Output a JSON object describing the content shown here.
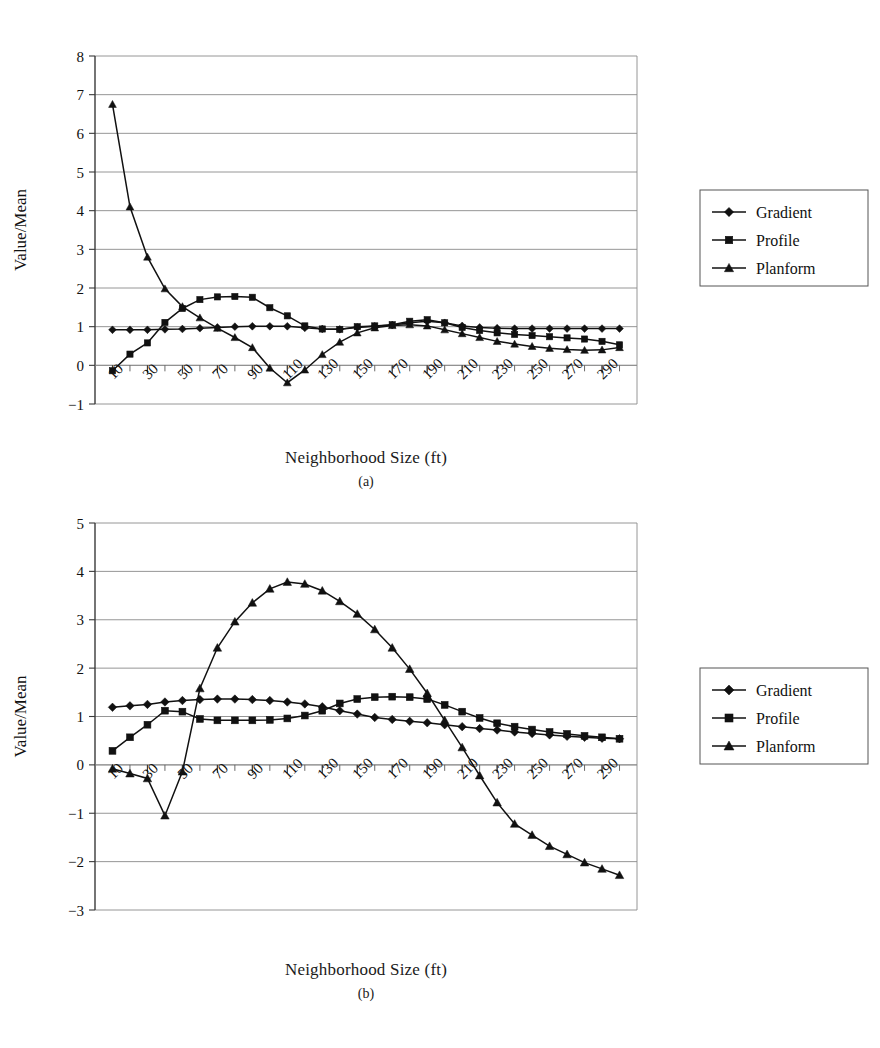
{
  "figure": {
    "panels": [
      {
        "id": "a",
        "caption": "(a)",
        "xlabel": "Neighborhood Size (ft)",
        "ylabel": "Value/Mean"
      },
      {
        "id": "b",
        "caption": "(b)",
        "xlabel": "Neighborhood Size (ft)",
        "ylabel": "Value/Mean"
      }
    ],
    "legend": {
      "entries": [
        {
          "label": "Gradient",
          "marker": "diamond"
        },
        {
          "label": "Profile",
          "marker": "square"
        },
        {
          "label": "Planform",
          "marker": "triangle"
        }
      ]
    }
  },
  "chart_data": [
    {
      "type": "line",
      "panel": "a",
      "title": "",
      "xlabel": "Neighborhood Size (ft)",
      "ylabel": "Value/Mean",
      "x": [
        10,
        20,
        30,
        40,
        50,
        60,
        70,
        80,
        90,
        100,
        110,
        120,
        130,
        140,
        150,
        160,
        170,
        180,
        190,
        200,
        210,
        220,
        230,
        240,
        250,
        260,
        270,
        280,
        290,
        300
      ],
      "xlim": [
        0,
        310
      ],
      "ylim": [
        -1,
        8
      ],
      "yticks": [
        -1,
        0,
        1,
        2,
        3,
        4,
        5,
        6,
        7,
        8
      ],
      "xticks": [
        10,
        30,
        50,
        70,
        90,
        110,
        130,
        150,
        170,
        190,
        210,
        230,
        250,
        270,
        290
      ],
      "xtick_labels": [
        "10",
        "30",
        "50",
        "70",
        "90",
        "110",
        "130",
        "150",
        "170",
        "190",
        "210",
        "230",
        "250",
        "270",
        "290"
      ],
      "grid": true,
      "legend_position": "right",
      "series": [
        {
          "name": "Gradient",
          "marker": "diamond",
          "values": [
            0.92,
            0.92,
            0.92,
            0.93,
            0.94,
            0.96,
            0.98,
            1.0,
            1.01,
            1.01,
            1.01,
            0.97,
            0.94,
            0.93,
            0.98,
            1.01,
            1.04,
            1.1,
            1.14,
            1.1,
            1.02,
            0.98,
            0.96,
            0.95,
            0.95,
            0.95,
            0.95,
            0.95,
            0.95,
            0.95
          ]
        },
        {
          "name": "Profile",
          "marker": "square",
          "values": [
            -0.14,
            0.29,
            0.58,
            1.11,
            1.47,
            1.7,
            1.77,
            1.78,
            1.76,
            1.49,
            1.28,
            1.02,
            0.94,
            0.93,
            1.0,
            1.02,
            1.05,
            1.14,
            1.18,
            1.1,
            0.98,
            0.9,
            0.84,
            0.8,
            0.77,
            0.74,
            0.71,
            0.68,
            0.62,
            0.53
          ]
        },
        {
          "name": "Planform",
          "marker": "triangle",
          "values": [
            6.75,
            4.1,
            2.8,
            1.98,
            1.52,
            1.23,
            0.96,
            0.72,
            0.46,
            -0.07,
            -0.45,
            -0.12,
            0.28,
            0.6,
            0.84,
            0.97,
            1.03,
            1.05,
            1.02,
            0.92,
            0.82,
            0.72,
            0.62,
            0.55,
            0.49,
            0.44,
            0.41,
            0.39,
            0.4,
            0.46
          ]
        }
      ]
    },
    {
      "type": "line",
      "panel": "b",
      "title": "",
      "xlabel": "Neighborhood Size (ft)",
      "ylabel": "Value/Mean",
      "x": [
        10,
        20,
        30,
        40,
        50,
        60,
        70,
        80,
        90,
        100,
        110,
        120,
        130,
        140,
        150,
        160,
        170,
        180,
        190,
        200,
        210,
        220,
        230,
        240,
        250,
        260,
        270,
        280,
        290,
        300
      ],
      "xlim": [
        0,
        310
      ],
      "ylim": [
        -3,
        5
      ],
      "yticks": [
        -3,
        -2,
        -1,
        0,
        1,
        2,
        3,
        4,
        5
      ],
      "xticks": [
        10,
        30,
        50,
        70,
        90,
        110,
        130,
        150,
        170,
        190,
        210,
        230,
        250,
        270,
        290
      ],
      "xtick_labels": [
        "10",
        "30",
        "50",
        "70",
        "90",
        "110",
        "130",
        "150",
        "170",
        "190",
        "210",
        "230",
        "250",
        "270",
        "290"
      ],
      "grid": true,
      "legend_position": "right",
      "series": [
        {
          "name": "Gradient",
          "marker": "diamond",
          "values": [
            1.19,
            1.22,
            1.25,
            1.3,
            1.33,
            1.35,
            1.36,
            1.36,
            1.35,
            1.33,
            1.3,
            1.26,
            1.2,
            1.12,
            1.05,
            0.98,
            0.94,
            0.9,
            0.87,
            0.83,
            0.79,
            0.75,
            0.72,
            0.68,
            0.65,
            0.62,
            0.59,
            0.57,
            0.55,
            0.54
          ]
        },
        {
          "name": "Profile",
          "marker": "square",
          "values": [
            0.29,
            0.57,
            0.83,
            1.12,
            1.1,
            0.95,
            0.92,
            0.92,
            0.92,
            0.93,
            0.96,
            1.02,
            1.12,
            1.27,
            1.36,
            1.4,
            1.41,
            1.4,
            1.36,
            1.24,
            1.1,
            0.97,
            0.86,
            0.79,
            0.73,
            0.68,
            0.64,
            0.6,
            0.57,
            0.54
          ]
        },
        {
          "name": "Planform",
          "marker": "triangle",
          "values": [
            -0.08,
            -0.18,
            -0.28,
            -1.05,
            -0.14,
            1.58,
            2.42,
            2.96,
            3.35,
            3.64,
            3.78,
            3.74,
            3.6,
            3.38,
            3.12,
            2.8,
            2.42,
            1.98,
            1.48,
            0.92,
            0.36,
            -0.22,
            -0.78,
            -1.22,
            -1.45,
            -1.68,
            -1.85,
            -2.02,
            -2.15,
            -2.28
          ]
        }
      ]
    }
  ]
}
